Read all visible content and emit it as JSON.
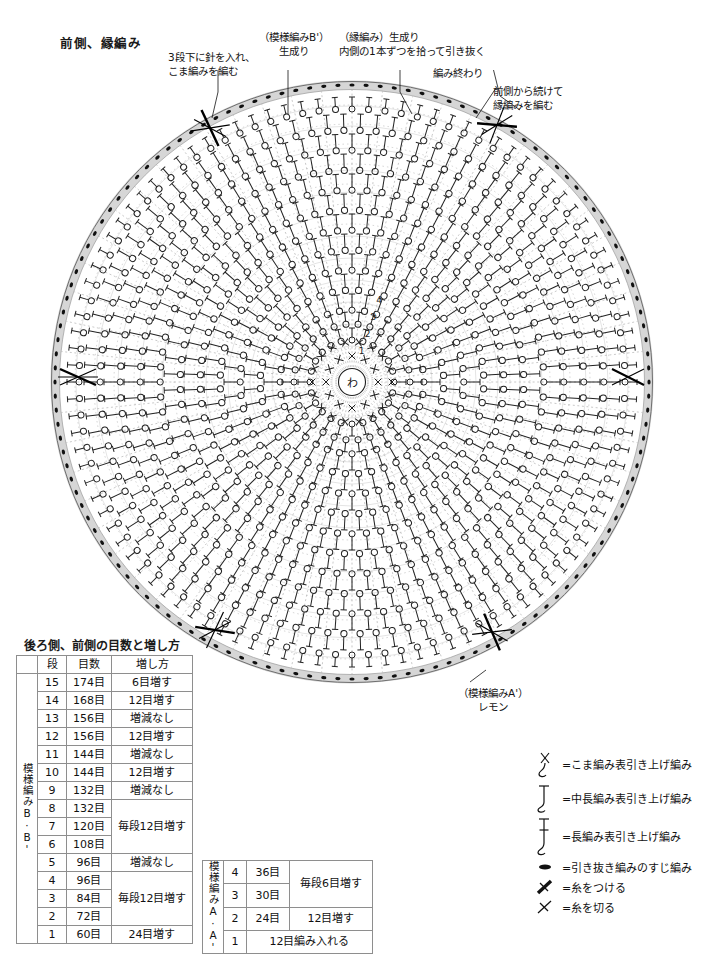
{
  "page": {
    "title": "前側、縁編み"
  },
  "annotations": [
    {
      "id": "anno-3dan",
      "lines": [
        "3段下に針を入れ、",
        "こま編みを編む"
      ]
    },
    {
      "id": "anno-patB",
      "lines": [
        "（模様編みB'）",
        "生成り"
      ]
    },
    {
      "id": "anno-edge",
      "lines": [
        "（縁編み）生成り",
        "内側の1本ずつを拾って引き抜く"
      ]
    },
    {
      "id": "anno-end",
      "lines": [
        "編み終わり"
      ]
    },
    {
      "id": "anno-front-cont",
      "lines": [
        "前側から続けて",
        "縁編みを編む"
      ]
    },
    {
      "id": "anno-lemon",
      "lines": [
        "（模様編みA'）",
        "レモン"
      ]
    }
  ],
  "chart_data": {
    "type": "diagram",
    "title": "前側、縁編み",
    "center_symbol": "わ",
    "round_labels": [
      "1",
      "2",
      "3",
      "4"
    ],
    "rounds": 15,
    "edge_style": "引き抜き編みのすじ編み",
    "colors": {
      "ink": "#141414",
      "edge_band": "#d8d8d8",
      "grid": "#8e8e8e"
    }
  },
  "table_b": {
    "title": "後ろ側、前側の目数と増し方",
    "group_label": "模様編みB·B'",
    "headers": [
      "",
      "段",
      "目数",
      "増し方"
    ],
    "rows": [
      {
        "dan": "15",
        "me": "174目",
        "inc": "6目増す",
        "inc_span": 1
      },
      {
        "dan": "14",
        "me": "168目",
        "inc": "12目増す",
        "inc_span": 1
      },
      {
        "dan": "13",
        "me": "156目",
        "inc": "増減なし",
        "inc_span": 1
      },
      {
        "dan": "12",
        "me": "156目",
        "inc": "12目増す",
        "inc_span": 1
      },
      {
        "dan": "11",
        "me": "144目",
        "inc": "増減なし",
        "inc_span": 1
      },
      {
        "dan": "10",
        "me": "144目",
        "inc": "12目増す",
        "inc_span": 1
      },
      {
        "dan": "9",
        "me": "132目",
        "inc": "増減なし",
        "inc_span": 1
      },
      {
        "dan": "8",
        "me": "132目",
        "inc": "毎段12目増す",
        "inc_span": 3
      },
      {
        "dan": "7",
        "me": "120目",
        "inc": null,
        "inc_span": 0
      },
      {
        "dan": "6",
        "me": "108目",
        "inc": null,
        "inc_span": 0
      },
      {
        "dan": "5",
        "me": "96目",
        "inc": "増減なし",
        "inc_span": 1
      },
      {
        "dan": "4",
        "me": "96目",
        "inc": "毎段12目増す",
        "inc_span": 3
      },
      {
        "dan": "3",
        "me": "84目",
        "inc": null,
        "inc_span": 0
      },
      {
        "dan": "2",
        "me": "72目",
        "inc": null,
        "inc_span": 0
      },
      {
        "dan": "1",
        "me": "60目",
        "inc": "24目増す",
        "inc_span": 1
      }
    ]
  },
  "table_a": {
    "group_label": "模様編みA·A'",
    "rows": [
      {
        "dan": "4",
        "me": "36目",
        "inc": "毎段6目増す",
        "inc_span": 2,
        "full": false
      },
      {
        "dan": "3",
        "me": "30目",
        "inc": null,
        "inc_span": 0,
        "full": false
      },
      {
        "dan": "2",
        "me": "24目",
        "inc": "12目増す",
        "inc_span": 1,
        "full": false
      },
      {
        "dan": "1",
        "me": "12目編み入れる",
        "inc": null,
        "inc_span": 0,
        "full": true
      }
    ]
  },
  "legend": {
    "items": [
      {
        "symbol": "koma-hikiage",
        "text": "=こま編み表引き上げ編み"
      },
      {
        "symbol": "chuncho-hikiage",
        "text": "=中長編み表引き上げ編み"
      },
      {
        "symbol": "naga-hikiage",
        "text": "=長編み表引き上げ編み"
      },
      {
        "symbol": "hikinuki-suji",
        "text": "=引き抜き編みのすじ編み"
      },
      {
        "symbol": "ito-tsukeru",
        "text": "=糸をつける"
      },
      {
        "symbol": "ito-kiru",
        "text": "=糸を切る"
      }
    ]
  }
}
